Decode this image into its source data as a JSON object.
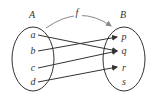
{
  "diagram": {
    "function_label": "f",
    "domain": {
      "label": "A",
      "elements": [
        "a",
        "b",
        "c",
        "d"
      ]
    },
    "codomain": {
      "label": "B",
      "elements": [
        "p",
        "q",
        "r",
        "s"
      ]
    },
    "mapping": [
      {
        "from": "a",
        "to": "q"
      },
      {
        "from": "b",
        "to": "p"
      },
      {
        "from": "c",
        "to": "q"
      },
      {
        "from": "d",
        "to": "r"
      }
    ]
  }
}
